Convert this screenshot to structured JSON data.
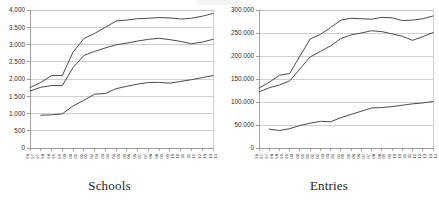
{
  "figure": {
    "panels": [
      {
        "id": "schools",
        "caption": "Schools"
      },
      {
        "id": "entries",
        "caption": "Entries"
      }
    ]
  },
  "chart_data": [
    {
      "type": "line",
      "title": "Schools",
      "xlabel": "",
      "ylabel": "",
      "grid": "horizontal",
      "legend": "none",
      "ylim": [
        0,
        4000
      ],
      "ytick_labels": [
        "0",
        "500",
        "1.000",
        "1.500",
        "2.000",
        "2.500",
        "3.000",
        "3.500",
        "4.000"
      ],
      "yticks": [
        0,
        500,
        1000,
        1500,
        2000,
        2500,
        3000,
        3500,
        4000
      ],
      "categories": [
        "96/97",
        "97/98",
        "98/99",
        "99/00",
        "00/01",
        "01/02",
        "02/03",
        "03/04",
        "04/05",
        "05/06",
        "06/07",
        "07/08",
        "08/09",
        "09/10",
        "10/11",
        "11/12",
        "12/13",
        "13/14"
      ],
      "series": [
        {
          "name": "series-top",
          "values": [
            1750,
            1900,
            2100,
            2100,
            2780,
            3170,
            3320,
            3500,
            3680,
            3710,
            3750,
            3760,
            3780,
            3770,
            3740,
            3760,
            3820,
            3900
          ]
        },
        {
          "name": "series-middle",
          "values": [
            1650,
            1760,
            1810,
            1810,
            2330,
            2680,
            2800,
            2900,
            2990,
            3040,
            3100,
            3150,
            3180,
            3140,
            3090,
            3020,
            3070,
            3150
          ]
        },
        {
          "name": "series-bottom",
          "values": [
            null,
            950,
            960,
            990,
            1220,
            1380,
            1560,
            1580,
            1720,
            1790,
            1850,
            1900,
            1900,
            1880,
            1930,
            1980,
            2040,
            2100
          ]
        }
      ]
    },
    {
      "type": "line",
      "title": "Entries",
      "xlabel": "",
      "ylabel": "",
      "grid": "horizontal",
      "legend": "none",
      "ylim": [
        0,
        300000
      ],
      "ytick_labels": [
        "0",
        "50.000",
        "100.000",
        "150.000",
        "200.000",
        "250.000",
        "300.000"
      ],
      "yticks": [
        0,
        50000,
        100000,
        150000,
        200000,
        250000,
        300000
      ],
      "categories": [
        "96/97",
        "97/98",
        "98/99",
        "99/00",
        "00/01",
        "01/02",
        "02/03",
        "03/04",
        "04/05",
        "05/06",
        "06/07",
        "07/08",
        "08/09",
        "09/10",
        "10/11",
        "11/12",
        "12/13",
        "13/14"
      ],
      "series": [
        {
          "name": "series-top",
          "values": [
            130000,
            143000,
            158000,
            162000,
            200000,
            237000,
            247000,
            262000,
            278000,
            282000,
            281000,
            280000,
            284000,
            283000,
            277000,
            278000,
            281000,
            287000
          ]
        },
        {
          "name": "series-middle",
          "values": [
            122000,
            131000,
            137000,
            146000,
            172000,
            198000,
            210000,
            222000,
            238000,
            246000,
            250000,
            255000,
            253000,
            248000,
            243000,
            234000,
            242000,
            251000
          ]
        },
        {
          "name": "series-bottom",
          "values": [
            null,
            41000,
            38000,
            42000,
            49000,
            54000,
            58000,
            57000,
            66000,
            73000,
            80000,
            87000,
            88000,
            90000,
            93000,
            96000,
            98000,
            101000
          ]
        }
      ]
    }
  ]
}
